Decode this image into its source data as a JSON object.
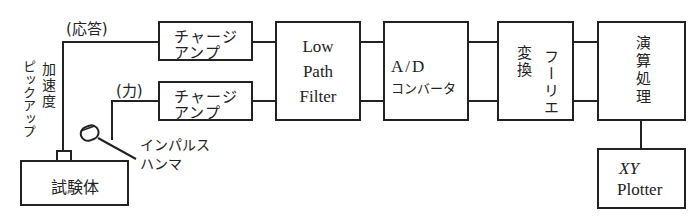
{
  "diagram": {
    "labels": {
      "response": "(応答)",
      "force": "(力)",
      "accel_pickup_line1": "加速度",
      "accel_pickup_line2": "ピックアップ",
      "impulse_hammer_line1": "インパルス",
      "impulse_hammer_line2": "ハンマ"
    },
    "blocks": {
      "test_body": "試験体",
      "charge_amp_1": {
        "line1": "チャージ",
        "line2": "アンプ"
      },
      "charge_amp_2": {
        "line1": "チャージ",
        "line2": "アンプ"
      },
      "lpf": {
        "line1": "Low",
        "line2": "Path",
        "line3": "Filter"
      },
      "adc": {
        "line1": "A/D",
        "line2": "コンバータ"
      },
      "fourier": {
        "col1": "変換",
        "col2": "フーリエ"
      },
      "processing": "演算処理",
      "plotter": {
        "line1": "XY",
        "line2": "Plotter"
      }
    },
    "line_color": "#222222"
  }
}
